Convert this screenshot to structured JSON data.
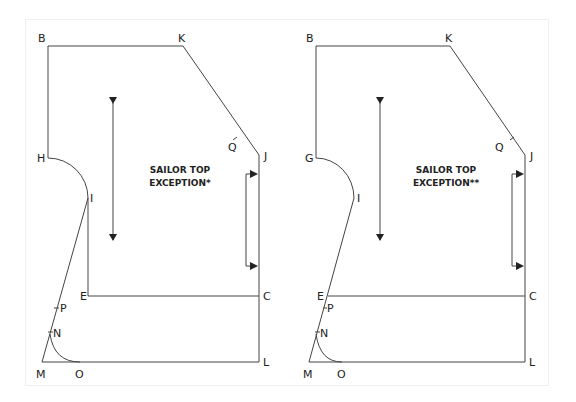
{
  "diagram": {
    "colors": {
      "line": "#444444",
      "text": "#222222",
      "frame": "#efefef",
      "background": "#ffffff"
    },
    "panels": [
      {
        "title_line1": "SAILOR TOP",
        "title_line2": "EXCEPTION*",
        "labels": {
          "B": "B",
          "K": "K",
          "Q": "Q",
          "J": "J",
          "H": "H",
          "I": "I",
          "E": "E",
          "C": "C",
          "P": "P",
          "N": "N",
          "M": "M",
          "O": "O",
          "L": "L"
        }
      },
      {
        "title_line1": "SAILOR TOP",
        "title_line2": "EXCEPTION**",
        "labels": {
          "B": "B",
          "K": "K",
          "Q": "Q",
          "J": "J",
          "G": "G",
          "I": "I",
          "E": "E",
          "C": "C",
          "P": "P",
          "N": "N",
          "M": "M",
          "O": "O",
          "L": "L"
        }
      }
    ]
  }
}
